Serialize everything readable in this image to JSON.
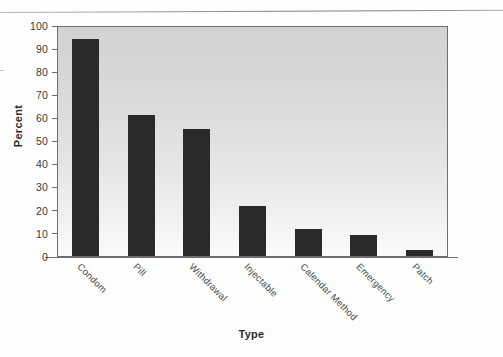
{
  "chart_data": {
    "type": "bar",
    "title": "",
    "xlabel": "Type",
    "ylabel": "Percent",
    "categories": [
      "Condom",
      "Pill",
      "Withdrawal",
      "Injectable",
      "Calendar Method",
      "Emergency",
      "Patch"
    ],
    "values": [
      94,
      61,
      55,
      21.5,
      11.5,
      9,
      2.5
    ],
    "ylim": [
      0,
      100
    ],
    "yticks": [
      0,
      10,
      20,
      30,
      40,
      50,
      60,
      70,
      80,
      90,
      100
    ],
    "ytick_labels": [
      "0",
      "10",
      "20",
      "30",
      "40",
      "50",
      "60",
      "70",
      "80",
      "90",
      "100"
    ],
    "grid": false,
    "legend": false,
    "bar_color": "#2a2a2a",
    "plot_background": "#dedede",
    "axis_color": "#6f6f6f"
  },
  "axes": {
    "y_title": "Percent",
    "x_title": "Type"
  }
}
